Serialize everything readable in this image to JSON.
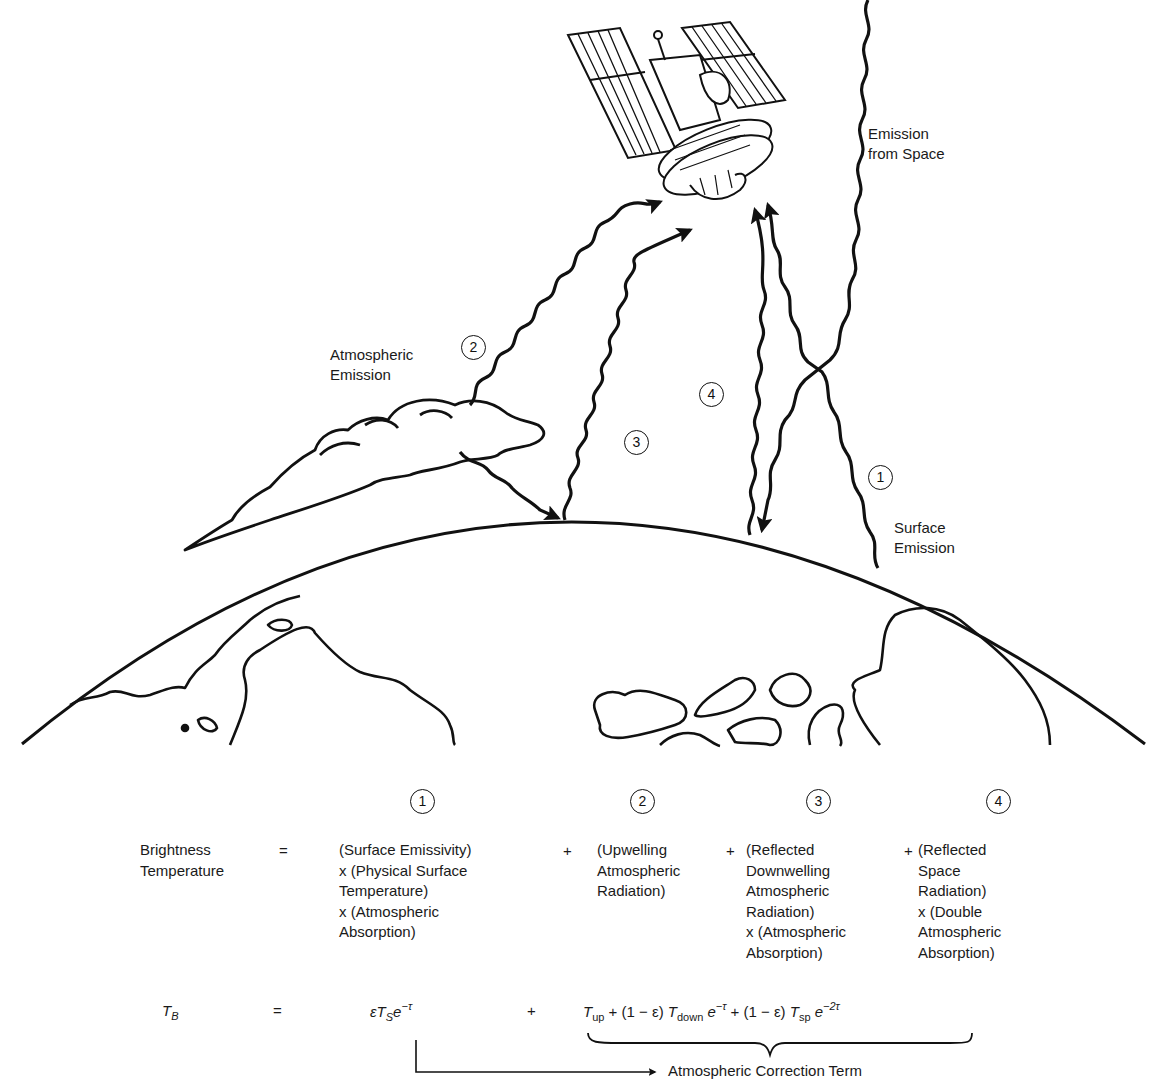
{
  "diagram": {
    "title_implied": "Microwave brightness temperature components observed by satellite",
    "labels": {
      "emission_from_space": "Emission\nfrom Space",
      "atmospheric_emission": "Atmospheric\nEmission",
      "surface_emission": "Surface\nEmission"
    },
    "markers": {
      "m1": "1",
      "m2": "2",
      "m3": "3",
      "m4": "4"
    },
    "paths": [
      {
        "id": 1,
        "name": "Surface Emission",
        "from": "surface",
        "to": "satellite"
      },
      {
        "id": 2,
        "name": "Atmospheric Emission (upwelling)",
        "from": "cloud",
        "to": "satellite"
      },
      {
        "id": 3,
        "name": "Reflected downwelling atmospheric radiation",
        "from": "cloud",
        "via": "surface",
        "to": "satellite"
      },
      {
        "id": 4,
        "name": "Reflected space radiation",
        "from": "space",
        "via": "surface",
        "to": "satellite"
      }
    ]
  },
  "equation": {
    "lhs_label": "Brightness\nTemperature",
    "equals": "=",
    "plus": "+",
    "terms": [
      {
        "number": "1",
        "text": "(Surface Emissivity)\nx (Physical Surface\nTemperature)\nx (Atmospheric\nAbsorption)"
      },
      {
        "number": "2",
        "text": "(Upwelling\nAtmospheric\nRadiation)"
      },
      {
        "number": "3",
        "text": "(Reflected\nDownwelling\nAtmospheric\nRadiation)\nx (Atmospheric\nAbsorption)"
      },
      {
        "number": "4",
        "text": "(Reflected\nSpace\nRadiation)\nx (Double\nAtmospheric\nAbsorption)"
      }
    ],
    "formula": {
      "lhs": "T",
      "lhs_sub": "B",
      "term1": "εT",
      "term1_sub": "S",
      "term1_exp_base": "e",
      "term1_exp": "−τ",
      "t_up": "T",
      "t_up_sub": "up",
      "one_minus_eps": "+ (1 − ε)",
      "t_down": "T",
      "t_down_sub": "down",
      "e": "e",
      "exp1": "−τ",
      "one_minus_eps2": "+ (1 − ε)",
      "t_sp": "T",
      "t_sp_sub": "sp",
      "exp2": "−2τ"
    },
    "correction_label": "Atmospheric Correction Term"
  }
}
